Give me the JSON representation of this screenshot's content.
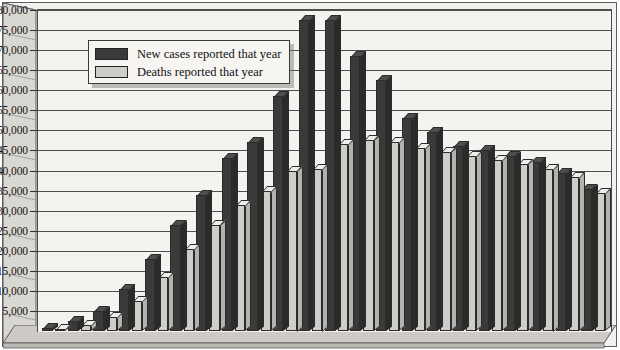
{
  "chart_data": {
    "type": "bar",
    "title": "",
    "subtitle": "",
    "xlabel": "",
    "ylabel": "",
    "ylim": [
      0,
      80000
    ],
    "ytick_step": 5000,
    "grid": true,
    "legend_position": "upper-left-inside",
    "orientation": "vertical-grouped-3d",
    "categories": [
      "1",
      "2",
      "3",
      "4",
      "5",
      "6",
      "7",
      "8",
      "9",
      "10",
      "11",
      "12",
      "13",
      "14",
      "15",
      "16",
      "17",
      "18",
      "19",
      "20",
      "21",
      "22"
    ],
    "ytick_labels": [
      "80,000",
      "75,000",
      "70,000",
      "65,000",
      "60,000",
      "55,000",
      "50,000",
      "45,000",
      "40,000",
      "35,000",
      "30,000",
      "25,000",
      "20,000",
      "15,000",
      "10,000",
      "5,000"
    ],
    "ytick_values": [
      80000,
      75000,
      70000,
      65000,
      60000,
      55000,
      50000,
      45000,
      40000,
      35000,
      30000,
      25000,
      20000,
      15000,
      10000,
      5000
    ],
    "series": [
      {
        "name": "New cases reported that year",
        "color": "#3a3a3a",
        "values": [
          700,
          2500,
          5000,
          10500,
          18000,
          26500,
          34000,
          43000,
          47000,
          58500,
          77500,
          77500,
          68500,
          62500,
          53000,
          49500,
          46000,
          45000,
          43500,
          42000,
          39500,
          35500
        ]
      },
      {
        "name": "Deaths reported that year",
        "color": "#cfcdc8",
        "values": [
          400,
          1500,
          3500,
          7500,
          13500,
          20500,
          26500,
          31500,
          35000,
          40000,
          40500,
          46500,
          47500,
          47000,
          45500,
          44500,
          43500,
          42500,
          41500,
          40500,
          38500,
          34500
        ]
      }
    ]
  },
  "legend": {
    "items": [
      {
        "label": "New cases reported that year",
        "swatch": "cases"
      },
      {
        "label": "Deaths reported that year",
        "swatch": "deaths"
      }
    ]
  },
  "colors": {
    "cases": "#3a3a3a",
    "deaths": "#cfcdc8",
    "plot_background": "#f4f3f0",
    "gridline": "#4f4f4f",
    "frame": "#4a4a4a",
    "text": "#161616"
  }
}
